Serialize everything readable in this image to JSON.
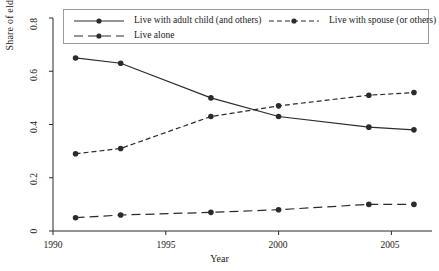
{
  "chart_data": {
    "type": "line",
    "title": "",
    "xlabel": "Year",
    "ylabel": "Share of elderly",
    "xlim": [
      1990,
      2006.8
    ],
    "ylim": [
      0,
      0.8
    ],
    "grid": false,
    "legend_position": "top-inside",
    "x": [
      1991,
      1993,
      1997,
      2000,
      2004,
      2006
    ],
    "xticks": [
      1990,
      1995,
      2000,
      2005
    ],
    "xticklabels": [
      "1990",
      "1995",
      "2000",
      "2005"
    ],
    "yticks": [
      0,
      0.2,
      0.4,
      0.6,
      0.8
    ],
    "yticklabels": [
      "0",
      "0.2",
      "0.4",
      "0.6",
      "0.8"
    ],
    "series": [
      {
        "name": "Live with adult child (and others)",
        "style": "solid",
        "marker": "circle",
        "color": "#2b2b2b",
        "values": [
          0.65,
          0.63,
          0.5,
          0.43,
          0.39,
          0.38
        ]
      },
      {
        "name": "Live with spouse (or others)",
        "style": "dashed",
        "marker": "circle",
        "color": "#2b2b2b",
        "values": [
          0.29,
          0.31,
          0.43,
          0.47,
          0.51,
          0.52
        ]
      },
      {
        "name": "Live alone",
        "style": "long-dash",
        "marker": "circle",
        "color": "#2b2b2b",
        "values": [
          0.05,
          0.06,
          0.07,
          0.08,
          0.1,
          0.1
        ]
      }
    ]
  },
  "axes": {
    "ylabel": "Share of elderly",
    "xlabel": "Year",
    "ytick_0": "0",
    "ytick_1": "0.2",
    "ytick_2": "0.4",
    "ytick_3": "0.6",
    "ytick_4": "0.8",
    "xtick_0": "1990",
    "xtick_1": "1995",
    "xtick_2": "2000",
    "xtick_3": "2005"
  },
  "legend": {
    "entry_0": "Live with adult child (and others)",
    "entry_1": "Live with spouse (or others)",
    "entry_2": "Live alone"
  }
}
